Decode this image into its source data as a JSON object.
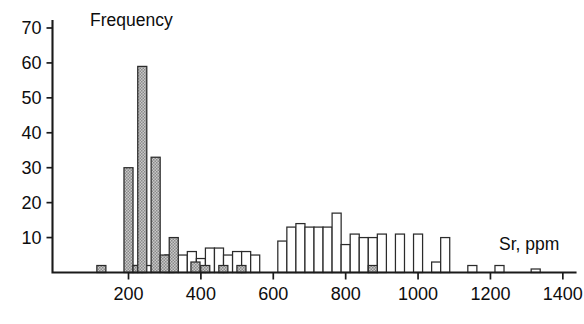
{
  "figure": {
    "width": 584,
    "height": 324,
    "background": "#ffffff",
    "axis_color": "#1a1a1a",
    "bar_outline_color": "#2b2b2b",
    "shaded_fill_color": "#9a9a9a",
    "open_fill_color": "#ffffff"
  },
  "chart_data": {
    "type": "bar",
    "title": "",
    "subtitle": "",
    "ylabel": "Frequency",
    "xlabel": "Sr, ppm",
    "ylim": [
      0,
      72
    ],
    "xlim": [
      -10,
      1435
    ],
    "grid": false,
    "legend": null,
    "y_ticks": [
      10,
      20,
      30,
      40,
      50,
      60,
      70
    ],
    "x_ticks": [
      200,
      400,
      600,
      800,
      1000,
      1200,
      1400
    ],
    "bin_width": 25,
    "annotations": [
      {
        "text": "Frequency",
        "role": "y-axis-title",
        "x": 90,
        "y": 24
      },
      {
        "text": "Sr, ppm",
        "role": "x-axis-title",
        "x": 540,
        "y": 248
      }
    ],
    "series": [
      {
        "name": "shaded",
        "style": "hatched-gray",
        "bins": [
          {
            "x": 125,
            "value": 2
          },
          {
            "x": 200,
            "value": 30
          },
          {
            "x": 225,
            "value": 2
          },
          {
            "x": 238,
            "value": 59
          },
          {
            "x": 275,
            "value": 33
          },
          {
            "x": 300,
            "value": 5
          },
          {
            "x": 325,
            "value": 10
          },
          {
            "x": 385,
            "value": 3
          },
          {
            "x": 412,
            "value": 2
          },
          {
            "x": 462,
            "value": 2
          },
          {
            "x": 512,
            "value": 2
          },
          {
            "x": 875,
            "value": 2
          }
        ]
      },
      {
        "name": "open",
        "style": "white-outline",
        "bins": [
          {
            "x": 213,
            "value": 2
          },
          {
            "x": 250,
            "value": 2
          },
          {
            "x": 313,
            "value": 5
          },
          {
            "x": 350,
            "value": 5
          },
          {
            "x": 375,
            "value": 6
          },
          {
            "x": 400,
            "value": 4
          },
          {
            "x": 425,
            "value": 7
          },
          {
            "x": 450,
            "value": 7
          },
          {
            "x": 475,
            "value": 5
          },
          {
            "x": 500,
            "value": 6
          },
          {
            "x": 525,
            "value": 6
          },
          {
            "x": 550,
            "value": 5
          },
          {
            "x": 625,
            "value": 9
          },
          {
            "x": 650,
            "value": 13
          },
          {
            "x": 675,
            "value": 14
          },
          {
            "x": 700,
            "value": 13
          },
          {
            "x": 725,
            "value": 13
          },
          {
            "x": 750,
            "value": 13
          },
          {
            "x": 775,
            "value": 17
          },
          {
            "x": 800,
            "value": 8
          },
          {
            "x": 825,
            "value": 11
          },
          {
            "x": 850,
            "value": 10
          },
          {
            "x": 875,
            "value": 10
          },
          {
            "x": 900,
            "value": 11
          },
          {
            "x": 950,
            "value": 11
          },
          {
            "x": 1000,
            "value": 11
          },
          {
            "x": 1050,
            "value": 3
          },
          {
            "x": 1075,
            "value": 10
          },
          {
            "x": 1150,
            "value": 2
          },
          {
            "x": 1225,
            "value": 2
          },
          {
            "x": 1325,
            "value": 1
          }
        ]
      }
    ]
  }
}
